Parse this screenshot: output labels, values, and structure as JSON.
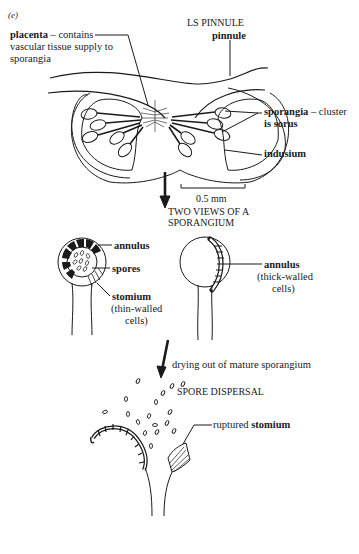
{
  "figure": {
    "panel_label": "(e)",
    "section_title": "LS PINNULE",
    "labels": {
      "pinnule": "pinnule",
      "placenta_bold": "placenta",
      "placenta_line1": " – contains",
      "placenta_line2": "vascular tissue supply to",
      "placenta_line3": "sporangia",
      "sporangia_bold": "sporangia",
      "sporangia_line1": " – cluster",
      "sporangia_line2": "is sorus",
      "indusium": "indusium",
      "scale_bar": "0.5 mm"
    },
    "two_views": {
      "title_line1": "TWO VIEWS OF A",
      "title_line2": "SPORANGIUM",
      "annulus_left": "annulus",
      "spores": "spores",
      "stomium": "stomium",
      "stomium_note1": "(thin-walled",
      "stomium_note2": "cells)",
      "annulus_right": "annulus",
      "annulus_note1": "(thick-walled",
      "annulus_note2": "cells)"
    },
    "dispersal": {
      "arrow_caption": "drying out of mature sporangium",
      "title": "SPORE DISPERSAL",
      "ruptured_prefix": "ruptured ",
      "ruptured_bold": "stomium"
    }
  }
}
